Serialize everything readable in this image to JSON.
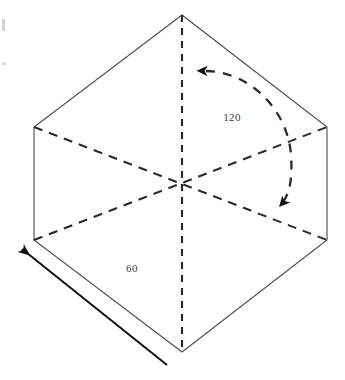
{
  "figure": {
    "canvas": {
      "width": 345,
      "height": 380
    },
    "background_color": "#ffffff",
    "outline_color": "#4a4a4a",
    "dashed_color": "#2b2b2b",
    "arrow_color": "#111111",
    "text_color": "#3b3b3b",
    "hexagon": {
      "vertices": [
        {
          "name": "top",
          "x": 182,
          "y": 15
        },
        {
          "name": "upper-right",
          "x": 327,
          "y": 127
        },
        {
          "name": "lower-right",
          "x": 327,
          "y": 240
        },
        {
          "name": "bottom",
          "x": 182,
          "y": 352
        },
        {
          "name": "lower-left",
          "x": 34,
          "y": 240
        },
        {
          "name": "upper-left",
          "x": 34,
          "y": 127
        }
      ],
      "center": {
        "x": 182,
        "y": 185
      }
    },
    "hidden_edges": [
      {
        "name": "vertical-axis",
        "from": "top",
        "to": "bottom"
      },
      {
        "name": "diagonal-upper-left-to-lower-right",
        "from": "upper-left",
        "to": "lower-right"
      },
      {
        "name": "diagonal-lower-left-to-upper-right",
        "from": "lower-left",
        "to": "upper-right"
      }
    ],
    "rotation_arc": {
      "label": "120",
      "label_x": 232,
      "label_y": 121,
      "start_arrowhead": "left",
      "end_arrowhead": "down-right",
      "style": "dashed"
    },
    "edge_dimension": {
      "label": "60",
      "label_x": 132,
      "label_y": 272,
      "arrowhead": "up-left",
      "style": "solid"
    },
    "labels": [
      {
        "name": "angle-label",
        "text": "120"
      },
      {
        "name": "edge-length-label",
        "text": "60"
      }
    ]
  }
}
